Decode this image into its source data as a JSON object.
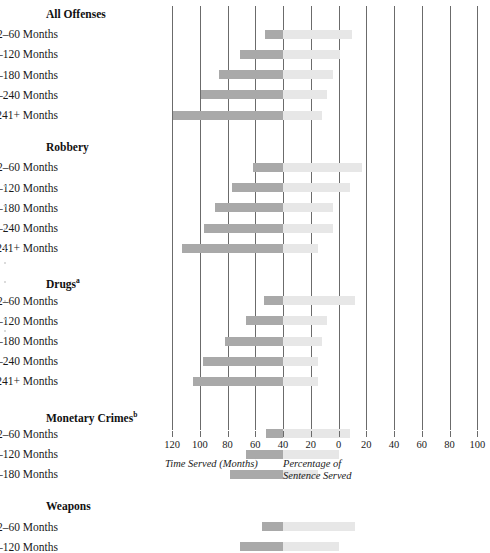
{
  "chart_data": {
    "type": "bar",
    "orientation": "horizontal",
    "style": "diverging-bidirectional",
    "title": "",
    "xlabel_left": "Time Served (Months)",
    "xlabel_right": "Percentage of\nSentence Served",
    "ylabel": "",
    "grid": true,
    "legend_position": "none",
    "left_axis": {
      "label": "Time Served (Months)",
      "ticks": [
        120,
        100,
        80,
        60,
        40,
        20,
        0
      ],
      "range": [
        120,
        0
      ],
      "direction": "right-to-left"
    },
    "right_axis": {
      "label": "Percentage of Sentence Served",
      "ticks": [
        0,
        20,
        40,
        60,
        80,
        100
      ],
      "range": [
        0,
        100
      ],
      "direction": "left-to-right"
    },
    "tick_labels": [
      "120",
      "100",
      "80",
      "60",
      "40",
      "20",
      "0",
      "20",
      "40",
      "60",
      "80",
      "100"
    ],
    "series": [
      {
        "name": "Time Served (Months)",
        "color": "#a9a9a9",
        "side": "left"
      },
      {
        "name": "Percentage of Sentence Served",
        "color": "#e7e7e7",
        "side": "right"
      }
    ],
    "groups": [
      {
        "label": "All Offenses",
        "footnote": "",
        "rows": [
          {
            "category": "12–60 Months",
            "months": 13,
            "percent": 50
          },
          {
            "category": "61–120 Months",
            "months": 31,
            "percent": 41
          },
          {
            "category": "121–180 Months",
            "months": 46,
            "percent": 36
          },
          {
            "category": "180–240 Months",
            "months": 59,
            "percent": 32
          },
          {
            "category": "241+ Months",
            "months": 79,
            "percent": 28
          }
        ]
      },
      {
        "label": "Robbery",
        "footnote": "",
        "rows": [
          {
            "category": "12–60 Months",
            "months": 22,
            "percent": 57
          },
          {
            "category": "61–120 Months",
            "months": 37,
            "percent": 48
          },
          {
            "category": "121–180 Months",
            "months": 49,
            "percent": 36
          },
          {
            "category": "180–240 Months",
            "months": 57,
            "percent": 36
          },
          {
            "category": "241+ Months",
            "months": 73,
            "percent": 25
          }
        ]
      },
      {
        "label": "Drugs",
        "footnote": "a",
        "rows": [
          {
            "category": "12–60 Months",
            "months": 14,
            "percent": 52
          },
          {
            "category": "61–120 Months",
            "months": 27,
            "percent": 32
          },
          {
            "category": "121–180 Months",
            "months": 42,
            "percent": 28
          },
          {
            "category": "180–240 Months",
            "months": 58,
            "percent": 25
          },
          {
            "category": "241+ Months",
            "months": 65,
            "percent": 25
          }
        ]
      },
      {
        "label": "Monetary Crimes",
        "footnote": "b",
        "rows": [
          {
            "category": "12–60 Months",
            "months": 12,
            "percent": 48
          },
          {
            "category": "61–120 Months",
            "months": 27,
            "percent": 40
          },
          {
            "category": "121–180 Months",
            "months": 38,
            "percent": 25
          }
        ]
      },
      {
        "label": "Weapons",
        "footnote": "",
        "rows": [
          {
            "category": "12–60 Months",
            "months": 15,
            "percent": 52
          },
          {
            "category": "61–120 Months",
            "months": 31,
            "percent": 40
          }
        ]
      }
    ]
  }
}
